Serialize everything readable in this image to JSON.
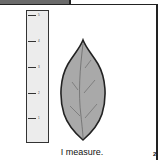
{
  "page": {
    "caption": "I measure.",
    "page_number": "2"
  },
  "ruler": {
    "ticks": [
      {
        "label": "5",
        "top": 4
      },
      {
        "label": "4",
        "top": 30
      },
      {
        "label": "3",
        "top": 56
      },
      {
        "label": "2",
        "top": 82
      },
      {
        "label": "1",
        "top": 107
      }
    ]
  },
  "leaf": {
    "fill": "#a9a9a9",
    "stroke": "#222222"
  }
}
